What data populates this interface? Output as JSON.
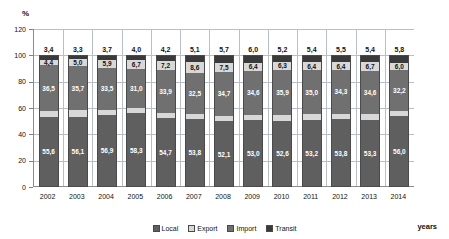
{
  "chart_data": {
    "type": "bar",
    "stacked": true,
    "title": "",
    "subtitle": "",
    "xlabel": "years",
    "ylabel": "%",
    "ylim": [
      0,
      120
    ],
    "yticks": [
      "0",
      "20",
      "40",
      "60",
      "80",
      "100",
      "120"
    ],
    "grid": true,
    "legend_position": "bottom",
    "categories": [
      "2002",
      "2003",
      "2004",
      "2005",
      "2006",
      "2007",
      "2008",
      "2009",
      "2010",
      "2011",
      "2012",
      "2013",
      "2014"
    ],
    "series": [
      {
        "name": "Local",
        "color": "#5f5f5f",
        "values": [
          55.6,
          56.1,
          56.9,
          58.3,
          54.7,
          53.8,
          52.1,
          53.0,
          52.6,
          53.2,
          53.8,
          53.3,
          56.0
        ],
        "labels": [
          "55,6",
          "56,1",
          "56,9",
          "58,3",
          "54,7",
          "53,8",
          "52,1",
          "53,0",
          "52,6",
          "53,2",
          "53,8",
          "53,3",
          "56,0"
        ]
      },
      {
        "name": "Export",
        "color": "#d8d8d8",
        "values": [
          4.5,
          5.2,
          3.9,
          4.0,
          4.2,
          4.1,
          4.7,
          4.6,
          4.6,
          4.4,
          4.5,
          4.4,
          4.0
        ],
        "labels": [
          "",
          "",
          "",
          "",
          "",
          "",
          "",
          "",
          "",
          "",
          "",
          "",
          ""
        ]
      },
      {
        "name": "Import",
        "color": "#707070",
        "values": [
          36.5,
          35.7,
          33.5,
          31.0,
          33.9,
          32.5,
          34.7,
          34.6,
          35.9,
          35.0,
          34.3,
          34.6,
          32.2
        ],
        "labels": [
          "36,5",
          "35,7",
          "33,5",
          "31,0",
          "33,9",
          "32,5",
          "34,7",
          "34,6",
          "35,9",
          "35,0",
          "34,3",
          "34,6",
          "32,2"
        ]
      },
      {
        "name": "Transit",
        "color": "#3a3a3a",
        "values": [
          3.4,
          3.3,
          3.7,
          4.0,
          4.2,
          5.1,
          5.7,
          6.0,
          5.2,
          5.4,
          5.5,
          5.4,
          5.8
        ],
        "labels": [
          "3,4",
          "3,3",
          "3,7",
          "4,0",
          "4,2",
          "5,1",
          "5,7",
          "6,0",
          "5,2",
          "5,4",
          "5,5",
          "5,4",
          "5,8"
        ]
      }
    ],
    "inner_band_labels": [
      "4,4",
      "5,0",
      "5,9",
      "6,7",
      "7,2",
      "8,6",
      "7,5",
      "6,4",
      "6,3",
      "6,4",
      "6,4",
      "6,7",
      "6,0"
    ],
    "inner_band_values": [
      4.4,
      5.0,
      5.9,
      6.7,
      7.2,
      8.6,
      7.5,
      6.4,
      6.3,
      6.4,
      6.4,
      6.7,
      6.0
    ]
  },
  "axes": {
    "y_unit": "%",
    "x_title": "years"
  },
  "legend": {
    "items": [
      {
        "label": "Local",
        "color": "#5f5f5f"
      },
      {
        "label": "Export",
        "color": "#d8d8d8"
      },
      {
        "label": "Import",
        "color": "#707070"
      },
      {
        "label": "Transit",
        "color": "#3a3a3a"
      }
    ]
  }
}
